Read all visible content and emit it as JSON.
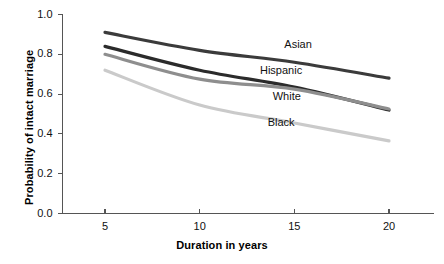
{
  "chart_data": {
    "type": "line",
    "title": "",
    "xlabel": "Duration in years",
    "ylabel": "Probability of intact marriage",
    "xlim": [
      3.0,
      22.0
    ],
    "ylim": [
      0.0,
      1.0
    ],
    "grid": false,
    "legend_position": "inline-annotations",
    "x": [
      5,
      10,
      15,
      20
    ],
    "xticks": [
      "5",
      "10",
      "15",
      "20"
    ],
    "yticks": [
      "0.0",
      "0.2",
      "0.4",
      "0.6",
      "0.8",
      "1.0"
    ],
    "series": [
      {
        "name": "Asian",
        "color": "#3b3b3b",
        "values": [
          0.91,
          0.82,
          0.76,
          0.68
        ],
        "label_x": 15.2,
        "label_y": 0.845
      },
      {
        "name": "Hispanic",
        "color": "#2b2b2b",
        "values": [
          0.84,
          0.72,
          0.635,
          0.52
        ],
        "label_x": 14.3,
        "label_y": 0.715
      },
      {
        "name": "White",
        "color": "#8e8e8e",
        "values": [
          0.8,
          0.675,
          0.625,
          0.525
        ],
        "label_x": 14.6,
        "label_y": 0.585
      },
      {
        "name": "Black",
        "color": "#cacaca",
        "values": [
          0.72,
          0.545,
          0.455,
          0.365
        ],
        "label_x": 14.3,
        "label_y": 0.455
      }
    ],
    "axis_color": "#555555",
    "line_width": 3.2
  }
}
